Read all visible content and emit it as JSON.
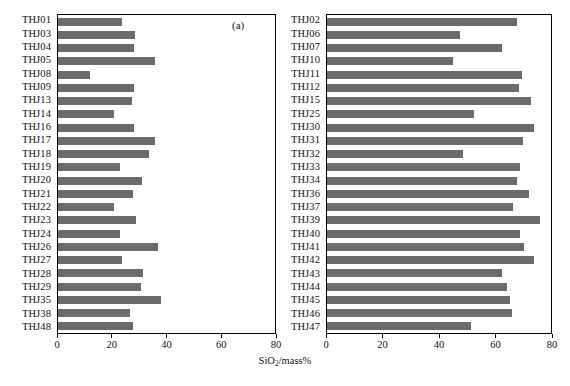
{
  "figure": {
    "xlabel_main": "SiO",
    "xlabel_sub": "2",
    "xlabel_tail": "/mass%",
    "bar_color": "#6b6b6b",
    "axis_color": "#000000"
  },
  "panels": [
    {
      "tag": "(a)",
      "name": "panel-a"
    },
    {
      "tag": "(b)",
      "name": "panel-b"
    }
  ],
  "ticks": {
    "values": [
      0,
      20,
      40,
      60,
      80
    ],
    "labels": [
      "0",
      "20",
      "40",
      "60",
      "80"
    ]
  },
  "chart_data": [
    {
      "type": "bar",
      "orientation": "horizontal",
      "title": "(a)",
      "xlabel": "SiO2/mass%",
      "ylabel": "",
      "xlim": [
        0,
        80
      ],
      "ylim": null,
      "grid": false,
      "legend": null,
      "categories": [
        "THJ01",
        "THJ03",
        "THJ04",
        "THJ05",
        "THJ08",
        "THJ09",
        "THJ13",
        "THJ14",
        "THJ16",
        "THJ17",
        "THJ18",
        "THJ19",
        "THJ20",
        "THJ21",
        "THJ22",
        "THJ23",
        "THJ24",
        "THJ26",
        "THJ27",
        "THJ28",
        "THJ29",
        "THJ35",
        "THJ38",
        "THJ48"
      ],
      "values": [
        23.5,
        28.3,
        27.9,
        35.6,
        11.7,
        27.9,
        27.2,
        20.5,
        27.9,
        35.6,
        33.4,
        22.7,
        31.0,
        27.8,
        20.6,
        28.6,
        22.7,
        36.8,
        23.6,
        31.4,
        30.6,
        37.8,
        26.6,
        27.6
      ],
      "tick_values": [
        0,
        20,
        40,
        60,
        80
      ]
    },
    {
      "type": "bar",
      "orientation": "horizontal",
      "title": "(b)",
      "xlabel": "SiO2/mass%",
      "ylabel": "",
      "xlim": [
        0,
        80
      ],
      "ylim": null,
      "grid": false,
      "legend": null,
      "categories": [
        "THJ02",
        "THJ06",
        "THJ07",
        "THJ10",
        "THJ11",
        "THJ12",
        "THJ15",
        "THJ25",
        "THJ30",
        "THJ31",
        "THJ32",
        "THJ33",
        "THJ34",
        "THJ36",
        "THJ37",
        "THJ39",
        "THJ40",
        "THJ41",
        "THJ42",
        "THJ43",
        "THJ44",
        "THJ45",
        "THJ46",
        "THJ47"
      ],
      "values": [
        68.0,
        47.6,
        62.4,
        45.0,
        69.7,
        68.6,
        72.9,
        52.6,
        73.8,
        70.0,
        48.4,
        69.0,
        67.8,
        72.0,
        66.6,
        76.0,
        68.8,
        70.4,
        74.0,
        62.6,
        64.4,
        65.4,
        66.0,
        51.6
      ],
      "tick_values": [
        0,
        20,
        40,
        60,
        80
      ]
    }
  ]
}
